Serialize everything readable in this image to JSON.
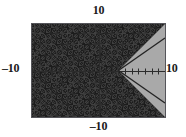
{
  "screen": {
    "kind": "graphing-calculator-screen",
    "width": 186,
    "height": 137
  },
  "labels": {
    "ymax": "10",
    "ymin": "–10",
    "xmin": "–10",
    "xmax": "10"
  },
  "colors": {
    "plot_background": "#a9a9a9",
    "frame_border": "#55555a",
    "shade_fill": "#1c1c1c",
    "curve": "#242424",
    "axis": "#2b2b2b",
    "text": "#1a1a1a",
    "page_background": "#ffffff"
  },
  "chart_data": {
    "type": "line",
    "title": "",
    "subtitle": "",
    "xlabel": "",
    "ylabel": "",
    "xlim": [
      -10,
      10
    ],
    "ylim": [
      -10,
      10
    ],
    "grid": false,
    "legend": null,
    "axes": {
      "x_axis_y": 0,
      "y_axis_x": 0,
      "x_tick_spacing": 1,
      "y_tick_spacing": 1,
      "tick_length_px": 3,
      "axis_style": "ticked-crosshair"
    },
    "tick_labels": {
      "x": [
        "-10",
        "10"
      ],
      "y": [
        "-10",
        "10"
      ]
    },
    "annotations": [
      {
        "text": "10",
        "position": "top",
        "meaning": "Ymax"
      },
      {
        "text": "-10",
        "position": "bottom",
        "meaning": "Ymin"
      },
      {
        "text": "-10",
        "position": "left",
        "meaning": "Xmin"
      },
      {
        "text": "10",
        "position": "right",
        "meaning": "Xmax"
      }
    ],
    "series": [
      {
        "name": "upper boundary ray",
        "kind": "ray",
        "expression": "y = x - 3, x >= 3",
        "points": [
          [
            3,
            0
          ],
          [
            10,
            7
          ]
        ],
        "style": "solid"
      },
      {
        "name": "lower boundary ray",
        "kind": "ray",
        "expression": "y = -(x - 3), x >= 3",
        "points": [
          [
            3,
            0
          ],
          [
            10,
            -7
          ]
        ],
        "style": "solid"
      }
    ],
    "shaded_regions": [
      {
        "name": "solution region",
        "description": "region to the left of the sideways V vertex at (3, 0), i.e. |y| >= x - 3",
        "inequality": "|y| >= x - 3",
        "fill": "#1c1c1c",
        "pattern": "solid-dither",
        "vertex": [
          3,
          0
        ],
        "boundary_points": [
          [
            -10,
            10
          ],
          [
            10,
            10
          ],
          [
            3,
            0
          ],
          [
            10,
            -10
          ],
          [
            -10,
            -10
          ]
        ]
      }
    ]
  }
}
